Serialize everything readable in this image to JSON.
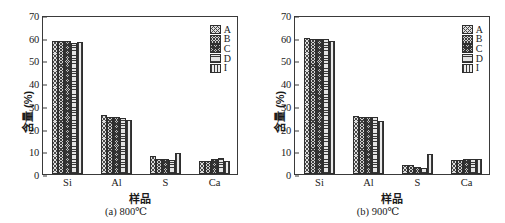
{
  "figure": {
    "panels": [
      {
        "id": "a",
        "caption": "(a) 800℃",
        "xlabel": "样品",
        "ylabel": "含量 (%)"
      },
      {
        "id": "b",
        "caption": "(b) 900℃",
        "xlabel": "样品",
        "ylabel": "含量 (%)"
      }
    ]
  },
  "axis": {
    "y_ticks": [
      "0",
      "10",
      "20",
      "30",
      "40",
      "50",
      "60",
      "70"
    ],
    "x_ticks": [
      "Si",
      "Al",
      "S",
      "Ca"
    ]
  },
  "legend": {
    "items": [
      {
        "label": "A",
        "pattern": "cross-hatch-wide"
      },
      {
        "label": "B",
        "pattern": "cross-hatch-medium"
      },
      {
        "label": "C",
        "pattern": "cross-hatch-dense"
      },
      {
        "label": "D",
        "pattern": "horizontal-lines"
      },
      {
        "label": "I",
        "pattern": "vertical-lines"
      }
    ]
  },
  "chart_data": [
    {
      "type": "bar",
      "title": "(a) 800℃",
      "xlabel": "样品",
      "ylabel": "含量 (%)",
      "categories": [
        "Si",
        "Al",
        "S",
        "Ca"
      ],
      "ylim": [
        0,
        70
      ],
      "ytick_step": 10,
      "grid": false,
      "legend_position": "top-right-inside",
      "series": [
        {
          "name": "A",
          "values": [
            58.6,
            25.9,
            7.8,
            5.9
          ]
        },
        {
          "name": "B",
          "values": [
            58.6,
            25.0,
            6.8,
            5.9
          ]
        },
        {
          "name": "C",
          "values": [
            58.5,
            24.9,
            6.7,
            6.5
          ]
        },
        {
          "name": "D",
          "values": [
            57.7,
            24.8,
            6.3,
            7.0
          ]
        },
        {
          "name": "I",
          "values": [
            58.3,
            23.7,
            9.3,
            5.9
          ]
        }
      ]
    },
    {
      "type": "bar",
      "title": "(b) 900℃",
      "xlabel": "样品",
      "ylabel": "含量 (%)",
      "categories": [
        "Si",
        "Al",
        "S",
        "Ca"
      ],
      "ylim": [
        0,
        70
      ],
      "ytick_step": 10,
      "grid": false,
      "legend_position": "top-right-inside",
      "series": [
        {
          "name": "A",
          "values": [
            60.0,
            25.4,
            4.0,
            6.3
          ]
        },
        {
          "name": "B",
          "values": [
            59.5,
            25.2,
            3.9,
            6.3
          ]
        },
        {
          "name": "C",
          "values": [
            59.4,
            25.2,
            3.0,
            6.5
          ]
        },
        {
          "name": "D",
          "values": [
            59.3,
            25.2,
            2.5,
            6.8
          ]
        },
        {
          "name": "I",
          "values": [
            58.5,
            23.5,
            9.0,
            6.4
          ]
        }
      ]
    }
  ]
}
